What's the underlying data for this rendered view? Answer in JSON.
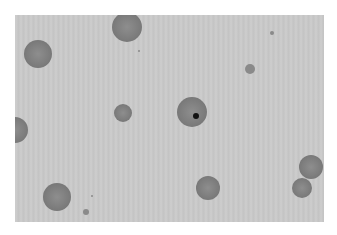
{
  "image": {
    "description": "Grayscale micrograph of round cells on a light gray field",
    "background_color": "#c9c9c9",
    "frame_color": "#ffffff"
  },
  "cells": [
    {
      "name": "cell-top-center",
      "cx": 127,
      "cy": 27,
      "r": 15
    },
    {
      "name": "cell-top-left",
      "cx": 38,
      "cy": 54,
      "r": 14
    },
    {
      "name": "cell-left-edge",
      "cx": 15,
      "cy": 130,
      "r": 13
    },
    {
      "name": "cell-center-small",
      "cx": 123,
      "cy": 113,
      "r": 9
    },
    {
      "name": "cell-center-nucleated",
      "cx": 192,
      "cy": 112,
      "r": 15
    },
    {
      "name": "cell-bottom-left",
      "cx": 57,
      "cy": 197,
      "r": 14
    },
    {
      "name": "cell-bottom-center",
      "cx": 208,
      "cy": 188,
      "r": 12
    },
    {
      "name": "cell-right-upper",
      "cx": 311,
      "cy": 167,
      "r": 12
    },
    {
      "name": "cell-right-lower",
      "cx": 302,
      "cy": 188,
      "r": 10
    }
  ],
  "specks": [
    {
      "cx": 250,
      "cy": 69,
      "r": 5
    },
    {
      "cx": 139,
      "cy": 51,
      "r": 1
    },
    {
      "cx": 272,
      "cy": 33,
      "r": 2
    },
    {
      "cx": 86,
      "cy": 212,
      "r": 3
    },
    {
      "cx": 92,
      "cy": 196,
      "r": 1
    }
  ],
  "nucleus": {
    "cx": 196,
    "cy": 116,
    "r": 3
  }
}
